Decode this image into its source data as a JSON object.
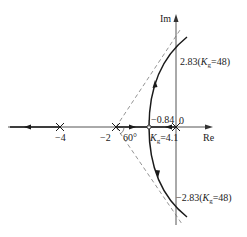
{
  "diagram": {
    "type": "root-locus",
    "axes": {
      "real_label": "Re",
      "imag_label": "Im"
    },
    "poles": [
      {
        "value": 0,
        "label": "0"
      },
      {
        "value": -2,
        "label": "−2"
      },
      {
        "value": -4,
        "label": "−4"
      }
    ],
    "breakaway": {
      "point_label": "−0.84",
      "gain_label_prefix": "K",
      "gain_label_sub": "g",
      "gain_label_value": "=4.1"
    },
    "imag_crossings": {
      "upper": {
        "value": "2.83(",
        "k": "K",
        "sub": "g",
        "rest": "=48)"
      },
      "lower": {
        "value": "−2.83(",
        "k": "K",
        "sub": "g",
        "rest": "=48)"
      }
    },
    "asymptote_angle_label": "60°",
    "colors": {
      "locus": "#1a1a1a",
      "axis": "#555555",
      "asymptote": "#777777"
    }
  }
}
